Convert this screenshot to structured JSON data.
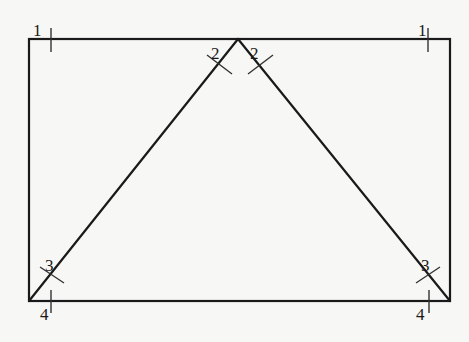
{
  "diagram": {
    "type": "geometry",
    "colors": {
      "background": "#f7f7f5",
      "stroke": "#1a1a1a"
    },
    "rectangle": {
      "x1": 29,
      "y1": 39,
      "x2": 450,
      "y2": 301
    },
    "triangle": {
      "apex": [
        238,
        39
      ],
      "left": [
        29,
        301
      ],
      "right": [
        450,
        301
      ]
    },
    "labels": [
      {
        "id": "top-left-1",
        "text": "1",
        "x": 33,
        "y": 36
      },
      {
        "id": "top-right-1",
        "text": "1",
        "x": 418,
        "y": 36
      },
      {
        "id": "apex-left-2",
        "text": "2",
        "x": 210,
        "y": 60
      },
      {
        "id": "apex-right-2",
        "text": "2",
        "x": 248,
        "y": 60
      },
      {
        "id": "bottom-left-3",
        "text": "3",
        "x": 46,
        "y": 270
      },
      {
        "id": "bottom-right-3",
        "text": "3",
        "x": 422,
        "y": 270
      },
      {
        "id": "bottom-left-4",
        "text": "4",
        "x": 40,
        "y": 320
      },
      {
        "id": "bottom-right-4",
        "text": "4",
        "x": 415,
        "y": 320
      }
    ]
  }
}
